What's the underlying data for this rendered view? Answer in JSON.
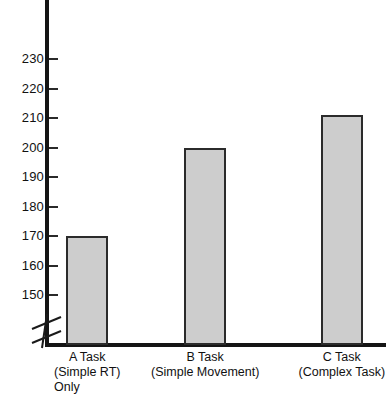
{
  "chart_data": {
    "type": "bar",
    "title": "",
    "xlabel": "",
    "ylabel": "",
    "categories": [
      "A Task",
      "B Task",
      "C Task"
    ],
    "category_sublabels": [
      [
        "(Simple RT)",
        "Only"
      ],
      [
        "(Simple Movement)"
      ],
      [
        "(Complex Task)"
      ]
    ],
    "values": [
      170,
      200,
      211
    ],
    "ylim": [
      145,
      235
    ],
    "yticks": [
      150,
      160,
      170,
      180,
      190,
      200,
      210,
      220,
      230
    ],
    "ytick_labels": [
      "150",
      "160",
      "170",
      "180",
      "190",
      "200",
      "210",
      "220",
      "230"
    ],
    "grid": false,
    "legend": "none",
    "axis_break": true,
    "bar_fill_color": "#cdcdcd",
    "bar_edge_color": "#2b2b2b",
    "axis_color": "#151515",
    "background_color": "#ffffff"
  }
}
